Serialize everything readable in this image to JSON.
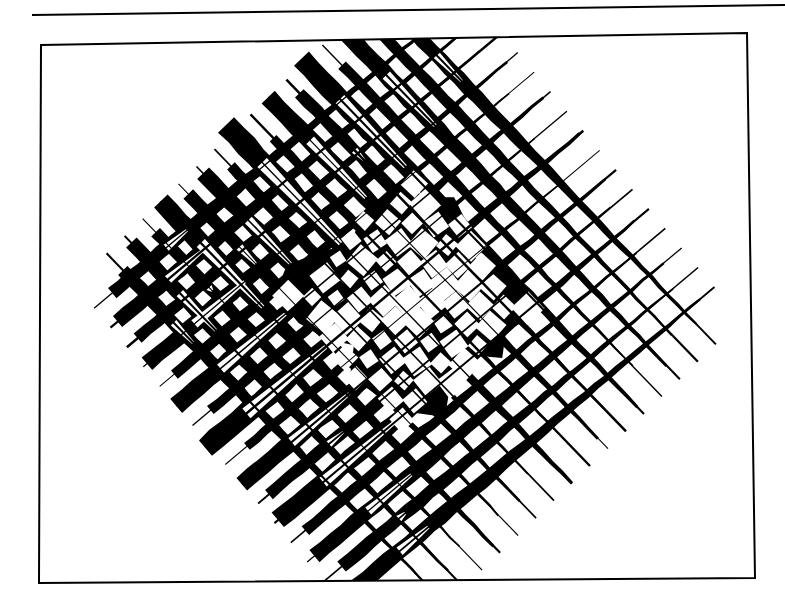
{
  "page": {
    "width": 785,
    "height": 602,
    "background_color": "#ffffff",
    "ink_color": "#000000",
    "caption": ""
  },
  "top_rule": {
    "name": "horizontal-rule",
    "x1": 0,
    "y1": 11,
    "x2": 753,
    "y2": 1,
    "thickness": 2,
    "color": "#000000"
  },
  "figure_frame": {
    "name": "figure-border",
    "stroke_color": "#000000",
    "stroke_width": 2,
    "fill": "#ffffff",
    "corners": {
      "top_left": {
        "x": 5,
        "y": 15
      },
      "top_right": {
        "x": 711,
        "y": 3
      },
      "bottom_right": {
        "x": 719,
        "y": 548
      },
      "bottom_left": {
        "x": 3,
        "y": 553
      }
    }
  },
  "artwork": {
    "title": "Crossed Woven Stripe Composition",
    "style": "high-contrast black-and-white abstract",
    "description": "Two perpendicular bands of parallel tapering stripes cross near the centre forming an X / pinwheel; stripes are solid black and heavy at their outer ends and thin to hairlines toward the centre, producing a dense plaid lattice where the two bands overlap.",
    "viewbox": {
      "width": 722,
      "height": 556
    },
    "center": {
      "x": 372,
      "y": 272
    },
    "bands": [
      {
        "id": "band-a",
        "name": "stripe-band-descending",
        "angle_deg": -40,
        "stripe_count": 16,
        "spacing": 25.5,
        "offset": -197,
        "length": 470,
        "stripes": [
          {
            "w_out": 13,
            "w_in": 2.2,
            "t_out": -0.47,
            "t_in": 0.44,
            "taper": 0.3,
            "break": 0.06
          },
          {
            "w_out": 15,
            "w_in": 2.0,
            "t_out": -0.5,
            "t_in": 0.47,
            "taper": 0.26,
            "break": 0.1
          },
          {
            "w_out": 12,
            "w_in": 1.6,
            "t_out": -0.49,
            "t_in": 0.46,
            "taper": 0.33,
            "break": 0.0
          },
          {
            "w_out": 16,
            "w_in": 2.4,
            "t_out": -0.51,
            "t_in": 0.49,
            "taper": 0.24,
            "break": 0.14
          },
          {
            "w_out": 11,
            "w_in": 1.5,
            "t_out": -0.48,
            "t_in": 0.45,
            "taper": 0.36,
            "break": 0.0
          },
          {
            "w_out": 18,
            "w_in": 2.8,
            "t_out": -0.52,
            "t_in": 0.5,
            "taper": 0.22,
            "break": 0.18
          },
          {
            "w_out": 10,
            "w_in": 1.4,
            "t_out": -0.47,
            "t_in": 0.43,
            "taper": 0.38,
            "break": 0.0
          },
          {
            "w_out": 21,
            "w_in": 3.0,
            "t_out": -0.53,
            "t_in": 0.51,
            "taper": 0.2,
            "break": 0.22
          },
          {
            "w_out": 9,
            "w_in": 1.3,
            "t_out": -0.46,
            "t_in": 0.42,
            "taper": 0.4,
            "break": 0.0
          },
          {
            "w_out": 17,
            "w_in": 2.6,
            "t_out": -0.52,
            "t_in": 0.49,
            "taper": 0.25,
            "break": 0.16
          },
          {
            "w_out": 12,
            "w_in": 1.8,
            "t_out": -0.49,
            "t_in": 0.46,
            "taper": 0.32,
            "break": 0.04
          },
          {
            "w_out": 19,
            "w_in": 2.5,
            "t_out": -0.51,
            "t_in": 0.48,
            "taper": 0.23,
            "break": 0.2
          },
          {
            "w_out": 11,
            "w_in": 1.5,
            "t_out": -0.48,
            "t_in": 0.44,
            "taper": 0.35,
            "break": 0.0
          },
          {
            "w_out": 15,
            "w_in": 2.2,
            "t_out": -0.5,
            "t_in": 0.47,
            "taper": 0.28,
            "break": 0.12
          },
          {
            "w_out": 13,
            "w_in": 1.7,
            "t_out": -0.47,
            "t_in": 0.45,
            "taper": 0.31,
            "break": 0.02
          },
          {
            "w_out": 16,
            "w_in": 2.3,
            "t_out": -0.5,
            "t_in": 0.48,
            "taper": 0.27,
            "break": 0.08
          }
        ]
      },
      {
        "id": "band-b",
        "name": "stripe-band-ascending",
        "angle_deg": 46,
        "stripe_count": 16,
        "spacing": 25.0,
        "offset": -192,
        "length": 470,
        "stripes": [
          {
            "w_out": 14,
            "w_in": 2.2,
            "t_out": -0.49,
            "t_in": 0.46,
            "taper": 0.29,
            "break": 0.08
          },
          {
            "w_out": 11,
            "w_in": 1.6,
            "t_out": -0.47,
            "t_in": 0.44,
            "taper": 0.34,
            "break": 0.0
          },
          {
            "w_out": 17,
            "w_in": 2.6,
            "t_out": -0.51,
            "t_in": 0.48,
            "taper": 0.24,
            "break": 0.15
          },
          {
            "w_out": 10,
            "w_in": 1.4,
            "t_out": -0.46,
            "t_in": 0.43,
            "taper": 0.37,
            "break": 0.0
          },
          {
            "w_out": 20,
            "w_in": 3.0,
            "t_out": -0.53,
            "t_in": 0.5,
            "taper": 0.21,
            "break": 0.2
          },
          {
            "w_out": 12,
            "w_in": 1.7,
            "t_out": -0.48,
            "t_in": 0.45,
            "taper": 0.33,
            "break": 0.03
          },
          {
            "w_out": 18,
            "w_in": 2.7,
            "t_out": -0.52,
            "t_in": 0.49,
            "taper": 0.23,
            "break": 0.17
          },
          {
            "w_out": 9,
            "w_in": 1.3,
            "t_out": -0.45,
            "t_in": 0.42,
            "taper": 0.4,
            "break": 0.0
          },
          {
            "w_out": 22,
            "w_in": 3.2,
            "t_out": -0.54,
            "t_in": 0.52,
            "taper": 0.19,
            "break": 0.24
          },
          {
            "w_out": 11,
            "w_in": 1.5,
            "t_out": -0.47,
            "t_in": 0.44,
            "taper": 0.35,
            "break": 0.0
          },
          {
            "w_out": 16,
            "w_in": 2.4,
            "t_out": -0.5,
            "t_in": 0.47,
            "taper": 0.26,
            "break": 0.13
          },
          {
            "w_out": 13,
            "w_in": 1.9,
            "t_out": -0.49,
            "t_in": 0.46,
            "taper": 0.3,
            "break": 0.05
          },
          {
            "w_out": 19,
            "w_in": 2.8,
            "t_out": -0.52,
            "t_in": 0.5,
            "taper": 0.22,
            "break": 0.19
          },
          {
            "w_out": 12,
            "w_in": 1.6,
            "t_out": -0.48,
            "t_in": 0.45,
            "taper": 0.32,
            "break": 0.01
          },
          {
            "w_out": 15,
            "w_in": 2.1,
            "t_out": -0.5,
            "t_in": 0.47,
            "taper": 0.28,
            "break": 0.11
          },
          {
            "w_out": 13,
            "w_in": 1.8,
            "t_out": -0.47,
            "t_in": 0.44,
            "taper": 0.31,
            "break": 0.06
          }
        ]
      }
    ],
    "center_lattice": {
      "name": "center-weave-lattice",
      "half_extent": 118,
      "cell": 24.0,
      "gap_ratio": 0.4,
      "rotation_deg": 3
    }
  }
}
